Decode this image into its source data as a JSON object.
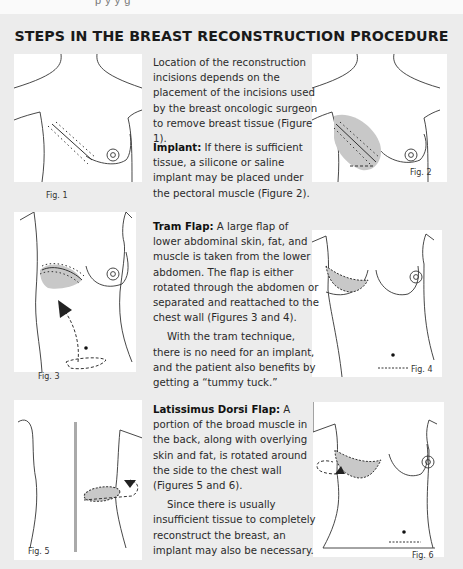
{
  "header": {
    "cut_off_text": "p y y g",
    "title": "STEPS IN THE BREAST RECONSTRUCTION PROCEDURE"
  },
  "figures": [
    {
      "id": 1,
      "label": "Fig. 1"
    },
    {
      "id": 2,
      "label": "Fig. 2"
    },
    {
      "id": 3,
      "label": "Fig. 3"
    },
    {
      "id": 4,
      "label": "Fig. 4"
    },
    {
      "id": 5,
      "label": "Fig. 5"
    },
    {
      "id": 6,
      "label": "Fig. 6"
    }
  ],
  "sections": {
    "intro": "Location of the reconstruction incisions depends on the placement of the incisions used by the breast oncologic surgeon to remove breast tissue (Figure 1).",
    "implant": {
      "heading": "Implant:",
      "body": " If there is sufficient tissue, a silicone or saline implant may be placed under the pectoral muscle (Figure 2)."
    },
    "tram": {
      "heading": "Tram Flap:",
      "body": " A large flap of lower abdominal skin, fat, and muscle is taken from the lower abdomen. The flap is either rotated through the abdomen or separated and reattached to the chest wall (Figures 3 and 4).",
      "para2": "With the tram technique, there is no need for an implant, and the patient also benefits by getting a “tummy tuck.”"
    },
    "latissimus": {
      "heading": "Latissimus Dorsi Flap:",
      "body": " A portion of the broad muscle in the back, along with overlying skin and fat, is rotated around the side to the chest wall (Figures 5 and 6).",
      "para2": "Since there is usually insufficient tissue to completely reconstruct the breast, an implant may also be necessary."
    }
  },
  "colors": {
    "page_bg": "#ececec",
    "figure_bg": "#ffffff",
    "shade": "#c8c8c8",
    "line": "#333333"
  }
}
